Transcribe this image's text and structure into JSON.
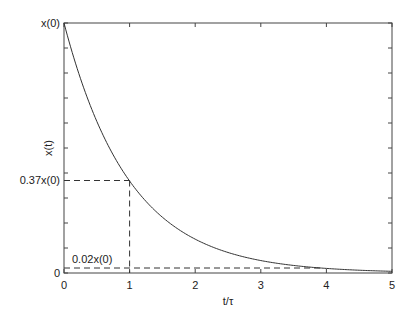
{
  "chart_data": {
    "type": "line",
    "title": "",
    "xlabel": "t/τ",
    "ylabel": "x(t)",
    "xlim": [
      0,
      5
    ],
    "ylim": [
      0,
      1
    ],
    "grid": false,
    "legend": null,
    "x_ticks": [
      0,
      1,
      2,
      3,
      4,
      5
    ],
    "x_tick_labels": [
      "0",
      "1",
      "2",
      "3",
      "4",
      "5"
    ],
    "y_tick_labels": [
      {
        "value": 1.0,
        "label": "x(0)"
      },
      {
        "value": 0.37,
        "label": "0.37x(0)"
      },
      {
        "value": 0,
        "label": "0"
      }
    ],
    "series": [
      {
        "name": "x(t) = x(0)·e^(-t/τ)",
        "x": [
          0,
          0.25,
          0.5,
          0.75,
          1,
          1.5,
          2,
          2.5,
          3,
          3.5,
          4,
          4.5,
          5
        ],
        "values": [
          1.0,
          0.78,
          0.61,
          0.47,
          0.37,
          0.22,
          0.135,
          0.082,
          0.05,
          0.03,
          0.018,
          0.011,
          0.007
        ]
      }
    ],
    "annotations": [
      {
        "type": "dashed-hline",
        "y": 0.37,
        "x_from": 0,
        "x_to": 1
      },
      {
        "type": "dashed-vline",
        "x": 1,
        "y_from": 0,
        "y_to": 0.37
      },
      {
        "type": "dashed-hline",
        "y": 0.02,
        "x_from": 0,
        "x_to": 3.9
      },
      {
        "type": "text",
        "label": "0.02x(0)",
        "x": 0.1,
        "y": 0.05
      }
    ]
  },
  "labels": {
    "xlabel": "t/τ",
    "ylabel": "x(t)",
    "y_top": "x(0)",
    "y_mid": "0.37x(0)",
    "y_zero": "0",
    "annot_002": "0.02x(0)",
    "x0": "0",
    "x1": "1",
    "x2": "2",
    "x3": "3",
    "x4": "4",
    "x5": "5"
  }
}
